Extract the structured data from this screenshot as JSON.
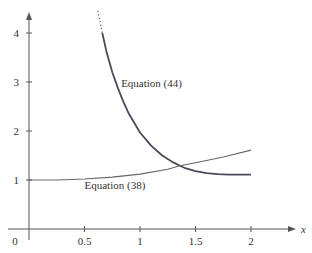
{
  "chart_data": {
    "type": "line",
    "title": "",
    "xlabel": "x",
    "ylabel": "",
    "xlim": [
      0,
      2.4
    ],
    "ylim": [
      0,
      4.4
    ],
    "grid": false,
    "legend": "none (inline curve labels)",
    "x_ticks": [
      "0.5",
      "1",
      "1.5",
      "2"
    ],
    "y_ticks": [
      "1",
      "2",
      "3",
      "4"
    ],
    "origin_label": "0",
    "series": [
      {
        "name": "Equation (44)",
        "label": "Equation (44)",
        "dotted_segment": {
          "x": [
            0.62,
            0.66
          ],
          "y": [
            4.45,
            4.0
          ]
        },
        "x": [
          0.66,
          0.7,
          0.75,
          0.8,
          0.85,
          0.9,
          1.0,
          1.1,
          1.2,
          1.3,
          1.36,
          1.4,
          1.5,
          1.6,
          1.7,
          1.8,
          1.9,
          2.0
        ],
        "y": [
          4.0,
          3.6,
          3.2,
          2.88,
          2.6,
          2.35,
          1.97,
          1.7,
          1.5,
          1.36,
          1.29,
          1.25,
          1.18,
          1.14,
          1.12,
          1.11,
          1.11,
          1.11
        ]
      },
      {
        "name": "Equation (38)",
        "label": "Equation (38)",
        "x": [
          0.0,
          0.25,
          0.5,
          0.75,
          1.0,
          1.25,
          1.36,
          1.5,
          1.75,
          2.0
        ],
        "y": [
          1.0,
          1.0,
          1.02,
          1.06,
          1.12,
          1.22,
          1.29,
          1.35,
          1.47,
          1.61
        ]
      }
    ],
    "annotations": [
      {
        "text": "Equation (44)",
        "x": 0.83,
        "y": 2.9
      },
      {
        "text": "Equation (38)",
        "x": 0.5,
        "y": 0.82
      }
    ]
  }
}
